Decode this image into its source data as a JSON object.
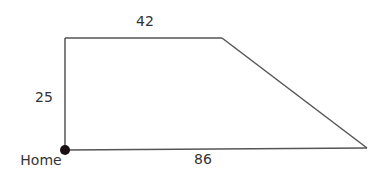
{
  "diagram": {
    "type": "trapezoid-path",
    "shape": {
      "vertices": {
        "home": {
          "x": 65,
          "y": 150
        },
        "top_left": {
          "x": 65,
          "y": 38
        },
        "top_right": {
          "x": 222,
          "y": 38
        },
        "bottom_right": {
          "x": 367,
          "y": 148
        }
      },
      "stroke_color": "#555555",
      "stroke_width": 1.5
    },
    "edges": [
      {
        "name": "left",
        "label": "25"
      },
      {
        "name": "top",
        "label": "42"
      },
      {
        "name": "slant",
        "label": ""
      },
      {
        "name": "bottom",
        "label": "86"
      }
    ],
    "home_point": {
      "label": "Home",
      "marker_color": "#1a0f14"
    }
  }
}
